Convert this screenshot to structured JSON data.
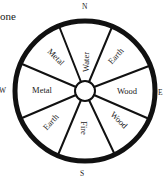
{
  "partial_text": "one",
  "compass": {
    "north": "N",
    "east": "E",
    "south": "S",
    "west": "W"
  },
  "segments": [
    {
      "position": "north",
      "label": "Water"
    },
    {
      "position": "northeast",
      "label": "Earth"
    },
    {
      "position": "east",
      "label": "Wood"
    },
    {
      "position": "southeast",
      "label": "Wood"
    },
    {
      "position": "south",
      "label": "Fire"
    },
    {
      "position": "southwest",
      "label": "Earth"
    },
    {
      "position": "west",
      "label": "Metal"
    },
    {
      "position": "northwest",
      "label": "Metal"
    }
  ],
  "colors": {
    "ink": "#111111",
    "background": "#ffffff"
  }
}
